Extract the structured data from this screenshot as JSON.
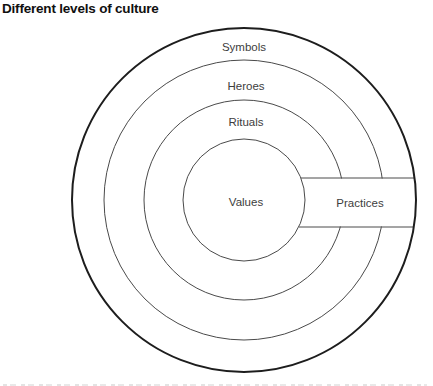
{
  "title": "Different levels of culture",
  "diagram": {
    "type": "concentric-onion-diagram",
    "rings_outer_to_inner": [
      "Symbols",
      "Heroes",
      "Rituals"
    ],
    "core_label": "Values",
    "crosscut_label": "Practices"
  },
  "labels": {
    "symbols": "Symbols",
    "heroes": "Heroes",
    "rituals": "Rituals",
    "values": "Values",
    "practices": "Practices"
  },
  "colors": {
    "background": "#ffffff",
    "outer_circle": "#1d1d1d",
    "inner_circles": "#4a4a4a",
    "label_text": "#3d3d3d",
    "title_text": "#101010"
  }
}
